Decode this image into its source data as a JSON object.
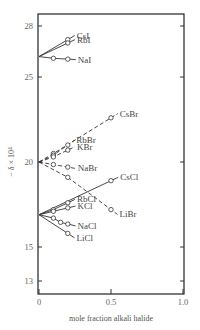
{
  "chart_data": {
    "type": "line",
    "title": "",
    "xlabel": "mole fraction alkali halide",
    "ylabel": "− δ × 10⁴",
    "xlim": [
      0,
      1.0
    ],
    "ylim": [
      12.2,
      28.7
    ],
    "x_ticks": [
      "0",
      "0.5",
      "1.0"
    ],
    "y_ticks": [
      "13",
      "15",
      "20",
      "25",
      "28"
    ],
    "grid": false,
    "legend": "inline labels",
    "series": [
      {
        "name": "CsI",
        "group": "iodide",
        "style": "solid",
        "x": [
          0,
          0.2
        ],
        "y": [
          26.2,
          27.2
        ]
      },
      {
        "name": "RbI",
        "group": "iodide",
        "style": "solid",
        "x": [
          0,
          0.2
        ],
        "y": [
          26.2,
          27.0
        ]
      },
      {
        "name": "NaI",
        "group": "iodide",
        "style": "solid",
        "x": [
          0,
          0.1,
          0.2
        ],
        "y": [
          26.2,
          26.1,
          26.05
        ]
      },
      {
        "name": "CsBr",
        "group": "bromide",
        "style": "dashed",
        "x": [
          0,
          0.1,
          0.5
        ],
        "y": [
          20.0,
          20.5,
          22.6
        ]
      },
      {
        "name": "RbBr",
        "group": "bromide",
        "style": "dashed",
        "x": [
          0,
          0.1,
          0.2
        ],
        "y": [
          20.0,
          20.4,
          21.0
        ]
      },
      {
        "name": "KBr",
        "group": "bromide",
        "style": "dashed",
        "x": [
          0,
          0.1,
          0.2
        ],
        "y": [
          20.0,
          20.3,
          20.7
        ]
      },
      {
        "name": "NaBr",
        "group": "bromide",
        "style": "dashed",
        "x": [
          0,
          0.1,
          0.2
        ],
        "y": [
          20.0,
          19.85,
          19.7
        ]
      },
      {
        "name": "LiBr",
        "group": "bromide",
        "style": "dashed",
        "x": [
          0,
          0.2,
          0.5
        ],
        "y": [
          20.0,
          19.1,
          17.2
        ]
      },
      {
        "name": "CsCl",
        "group": "chloride",
        "style": "solid",
        "x": [
          0,
          0.5
        ],
        "y": [
          16.9,
          18.9
        ]
      },
      {
        "name": "RbCl",
        "group": "chloride",
        "style": "solid",
        "x": [
          0,
          0.1,
          0.2
        ],
        "y": [
          16.9,
          17.2,
          17.6
        ]
      },
      {
        "name": "KCl",
        "group": "chloride",
        "style": "solid",
        "x": [
          0,
          0.1,
          0.2
        ],
        "y": [
          16.9,
          17.1,
          17.3
        ]
      },
      {
        "name": "NaCl",
        "group": "chloride",
        "style": "solid",
        "x": [
          0,
          0.1,
          0.15,
          0.2
        ],
        "y": [
          16.9,
          16.7,
          16.45,
          16.35
        ]
      },
      {
        "name": "LiCl",
        "group": "chloride",
        "style": "solid",
        "x": [
          0,
          0.2
        ],
        "y": [
          16.9,
          15.8
        ]
      }
    ]
  }
}
